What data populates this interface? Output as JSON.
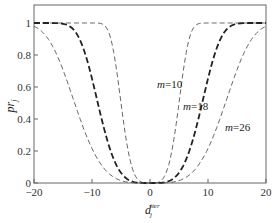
{
  "chart_data": {
    "type": "line",
    "title": "",
    "xlabel": "d_j^iter",
    "xlabel_main": "d",
    "xlabel_sub": "j",
    "xlabel_sup": "iter",
    "ylabel": "pr_j",
    "ylabel_main": "pr",
    "ylabel_sub": "j",
    "xlim": [
      -20,
      20
    ],
    "ylim": [
      0,
      1.1
    ],
    "xticks": [
      -20,
      -10,
      0,
      10,
      20
    ],
    "xtick_labels": [
      "−20",
      "−10",
      "0",
      "10",
      "20"
    ],
    "yticks": [
      0,
      0.2,
      0.4,
      0.6,
      0.8,
      1
    ],
    "ytick_labels": [
      "0",
      "0.2",
      "0.4",
      "0.6",
      "0.8",
      "1"
    ],
    "grid": false,
    "legend": "inline annotations",
    "x": [
      -20,
      -18,
      -16,
      -14,
      -12,
      -10,
      -8,
      -6,
      -4,
      -2,
      0,
      2,
      4,
      6,
      8,
      10,
      12,
      14,
      16,
      18,
      20
    ],
    "series": [
      {
        "name": "m=10",
        "label_m": "m",
        "label_val": "=10",
        "half_width": 5,
        "style": "thin-dashed",
        "values": [
          1,
          1,
          1,
          1,
          1,
          1,
          0.989,
          0.762,
          0.247,
          0.018,
          0,
          0.018,
          0.247,
          0.762,
          0.989,
          1,
          1,
          1,
          1,
          1,
          1
        ]
      },
      {
        "name": "m=18",
        "label_m": "m",
        "label_val": "=18",
        "half_width": 9,
        "style": "bold-dashed",
        "values": [
          1,
          1,
          0.999,
          0.983,
          0.888,
          0.652,
          0.351,
          0.128,
          0.027,
          0.002,
          0,
          0.002,
          0.027,
          0.128,
          0.351,
          0.652,
          0.888,
          0.983,
          0.999,
          1,
          1
        ]
      },
      {
        "name": "m=26",
        "label_m": "m",
        "label_val": "=26",
        "half_width": 13,
        "style": "thin-dashed",
        "values": [
          0.979,
          0.922,
          0.796,
          0.606,
          0.395,
          0.215,
          0.095,
          0.031,
          0.006,
          0,
          0,
          0,
          0.006,
          0.031,
          0.095,
          0.215,
          0.395,
          0.606,
          0.796,
          0.922,
          0.979
        ]
      }
    ]
  },
  "colors": {
    "axis": "#555555",
    "curve": "#333333"
  }
}
